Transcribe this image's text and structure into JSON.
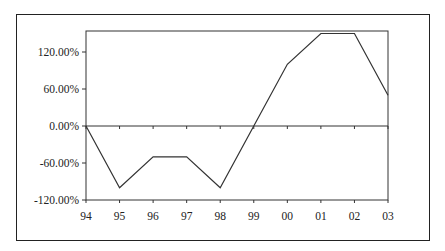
{
  "chart_data": {
    "type": "line",
    "title": "",
    "xlabel": "",
    "ylabel": "",
    "categories": [
      "94",
      "95",
      "96",
      "97",
      "98",
      "99",
      "00",
      "01",
      "02",
      "03"
    ],
    "series": [
      {
        "name": "",
        "values": [
          0,
          -100,
          -50,
          -50,
          -100,
          0,
          100,
          150,
          150,
          50
        ]
      }
    ],
    "y_ticks": [
      "120.00%",
      "60.00%",
      "0.00%",
      "-60.00%",
      "-120.00%"
    ],
    "y_tick_values": [
      120,
      60,
      0,
      -60,
      -120
    ],
    "ylim": [
      -120,
      156
    ],
    "grid": false,
    "legend": "none",
    "line_color": "#333333"
  }
}
